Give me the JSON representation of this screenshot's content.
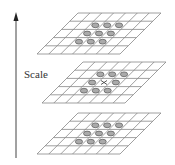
{
  "axis": {
    "label": "Scale",
    "direction": "up"
  },
  "grid": {
    "columns": 7,
    "rows": 5
  },
  "levels": [
    {
      "name": "level-top",
      "x0": 37,
      "y0": 13,
      "center_marker": false
    },
    {
      "name": "level-middle",
      "x0": 42,
      "y0": 62,
      "center_marker": true
    },
    {
      "name": "level-bottom",
      "x0": 37,
      "y0": 113,
      "center_marker": false
    }
  ],
  "neighborhood": {
    "size": "3x3",
    "col_start": 2,
    "row_start": 1
  },
  "colors": {
    "line": "#888888",
    "ellipse_fill": "#aaaaaa",
    "ellipse_stroke": "#555555",
    "arrow": "#444444"
  }
}
